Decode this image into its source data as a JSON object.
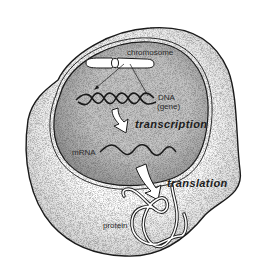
{
  "diagram": {
    "labels": {
      "chromosome": "chromosome",
      "dna": "DNA",
      "gene": "(gene)",
      "transcription": "transcription",
      "mrna": "mRNA",
      "translation": "translation",
      "protein": "protein"
    },
    "regions": {
      "cell": "cytoplasm",
      "nucleus": "nucleus"
    },
    "colors": {
      "background": "#ffffff",
      "cytoplasm_fill": "#f2f2f2",
      "nucleus_fill": "#b9b9b9",
      "outline": "#1a1a1a",
      "text": "#2a2a2a"
    }
  }
}
